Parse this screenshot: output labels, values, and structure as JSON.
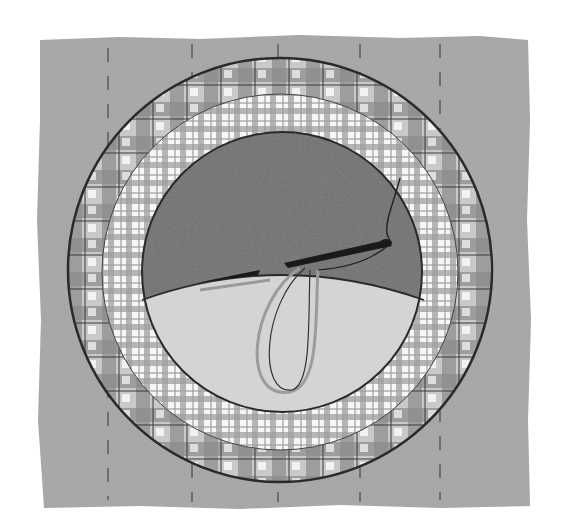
{
  "scene": {
    "description": "Illustration of an embroidery hoop with plaid fabric and needle and thread",
    "colors": {
      "background": "#ffffff",
      "fabric_square": "#a6a6a6",
      "dash_line": "#6e6e6e",
      "outer_ring_dark": "#7a7a7a",
      "outer_ring_light": "#d8d8d8",
      "inner_ring_base": "#f4f4f4",
      "inner_ring_check": "#9a9a9a",
      "circle_dark": "#6f6f6f",
      "circle_light": "#d4d4d4",
      "outline": "#2a2a2a",
      "needle": "#1a1a1a",
      "thread_light": "#9c9c9c"
    },
    "elements": [
      {
        "name": "fabric-square",
        "label": "Gray fabric background"
      },
      {
        "name": "dashed-guide-lines",
        "label": "Vertical dashed stitch lines",
        "count": 5
      },
      {
        "name": "outer-hoop-ring",
        "label": "Outer plaid hoop ring"
      },
      {
        "name": "inner-hoop-ring",
        "label": "Inner gingham ring"
      },
      {
        "name": "hoop-center",
        "label": "Center circle with dark upper and light lower halves"
      },
      {
        "name": "needle",
        "label": "Sewing needle"
      },
      {
        "name": "thread-loop",
        "label": "Thread loop"
      }
    ]
  }
}
